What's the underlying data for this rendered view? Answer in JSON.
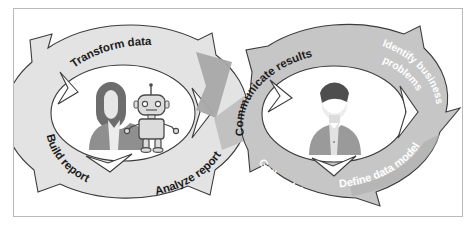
{
  "figure": {
    "name": "data-analytics-lifecycle-diagram",
    "type": "two-interlocking-cyclic-process-diagram",
    "border_color": "#b9b9b9",
    "background_color": "#ffffff"
  },
  "palette": {
    "left_cycle_fill": "#e3e3e3",
    "left_cycle_stroke": "#3c3c3c",
    "right_cycle_fill": "#c6c6c6",
    "right_cycle_stroke": "#3c3c3c",
    "shadow_fill": "#a8a8a8",
    "inner_white": "#ffffff",
    "label_dark": "#1d1d1d",
    "label_light": "#ffffff",
    "avatar_hair_dark": "#5e5e5e",
    "avatar_body_mid": "#9a9a9a",
    "avatar_face_light": "#ededed",
    "robot_body": "#dcdcdc",
    "robot_stroke": "#4a4a4a"
  },
  "left_cycle": {
    "name": "analytics-build-cycle",
    "fill": "#e3e3e3",
    "labels": [
      {
        "id": "transform-data",
        "text": "Transform data",
        "tone": "dark"
      },
      {
        "id": "analyze-report",
        "text": "Analyze report",
        "tone": "dark"
      },
      {
        "id": "build-report",
        "text": "Build report",
        "tone": "dark"
      }
    ],
    "center_figures": [
      {
        "id": "analyst-avatar",
        "kind": "person-long-hair"
      },
      {
        "id": "robot-avatar",
        "kind": "robot"
      }
    ]
  },
  "right_cycle": {
    "name": "business-requirements-cycle",
    "fill": "#c6c6c6",
    "labels": [
      {
        "id": "communicate-results",
        "text": "Communicate results",
        "tone": "dark"
      },
      {
        "id": "identify-business-problems",
        "text": "Identify business",
        "text2": "problems",
        "tone": "light"
      },
      {
        "id": "define-data-model",
        "text": "Define data model",
        "tone": "light"
      },
      {
        "id": "gather-data",
        "text": "Gather data",
        "tone": "light"
      }
    ],
    "center_figures": [
      {
        "id": "stakeholder-avatar",
        "kind": "person-short-hair"
      }
    ]
  }
}
